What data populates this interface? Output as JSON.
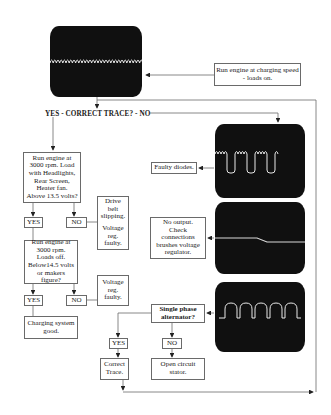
{
  "diagram": {
    "type": "flowchart",
    "start_label": "Run engine at charging speed - loads on.",
    "decision_main": "YES - CORRECT TRACE? - NO",
    "yes_branch": {
      "test1": [
        "Run engine at",
        "3000 rpm.  Load",
        "with Headlights,",
        "Rear Screen,",
        "Heater fan.",
        "Above 13.5 volts?"
      ],
      "test1_yes": "YES",
      "test1_no": "NO",
      "test1_no_result": [
        "Drive",
        "belt",
        "slipping.",
        "",
        "Voltage",
        "reg.",
        "faulty."
      ],
      "test2": [
        "Run engine at",
        "3000 rpm.",
        "Loads off.",
        "Below14.5 volts",
        "or makers",
        "figure?"
      ],
      "test2_yes": "YES",
      "test2_no": "NO",
      "test2_no_result": [
        "Voltage",
        "reg.",
        "faulty."
      ],
      "test2_yes_result": [
        "Charging system",
        "good."
      ]
    },
    "no_branch": {
      "trace_faulty_diodes": "Faulty diodes.",
      "trace_no_output": [
        "No output.",
        "Check",
        "connections",
        "brushes voltage",
        "regulator."
      ],
      "trace_single_phase_question": [
        "Single phase",
        "alternator?"
      ],
      "single_phase_yes": "YES",
      "single_phase_no": "NO",
      "single_phase_yes_result": [
        "Correct",
        "Trace."
      ],
      "single_phase_no_result": [
        "Open circuit",
        "stator."
      ]
    },
    "screens": [
      {
        "name": "correct-trace",
        "waveform": "ripple"
      },
      {
        "name": "faulty-diodes-trace",
        "waveform": "ripple-with-dips"
      },
      {
        "name": "no-output-trace",
        "waveform": "flat-step"
      },
      {
        "name": "single-phase-trace",
        "waveform": "half-wave-humps"
      }
    ],
    "colors": {
      "screen": "#101010",
      "trace": "#e8e8e8",
      "lines": "#6a6a6a"
    }
  }
}
